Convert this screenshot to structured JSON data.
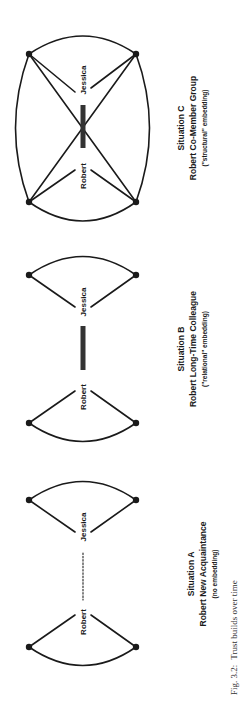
{
  "figure": {
    "caption_label": "Fig. 3.2:",
    "caption_text": "Trust builds over time",
    "colors": {
      "ink": "#1a1a1a",
      "tie_strong": "#333333",
      "background": "#ffffff"
    }
  },
  "situations": [
    {
      "id": "C",
      "title": "Situation C",
      "subtitle": "Robert Co-Member Group",
      "note": "(\"structural\" embedding)",
      "node_a": "Robert",
      "node_b": "Jessica",
      "tie": "strong",
      "network": "fully connected group"
    },
    {
      "id": "B",
      "title": "Situation B",
      "subtitle": "Robert Long-Time Colleague",
      "note": "(\"relational\" embedding)",
      "node_a": "Robert",
      "node_b": "Jessica",
      "tie": "strong",
      "network": "separate contacts"
    },
    {
      "id": "A",
      "title": "Situation A",
      "subtitle": "Robert New Acquaintance",
      "note": "(no embedding)",
      "node_a": "Robert",
      "node_b": "Jessica",
      "tie": "weak (dotted)",
      "network": "separate contacts"
    }
  ]
}
